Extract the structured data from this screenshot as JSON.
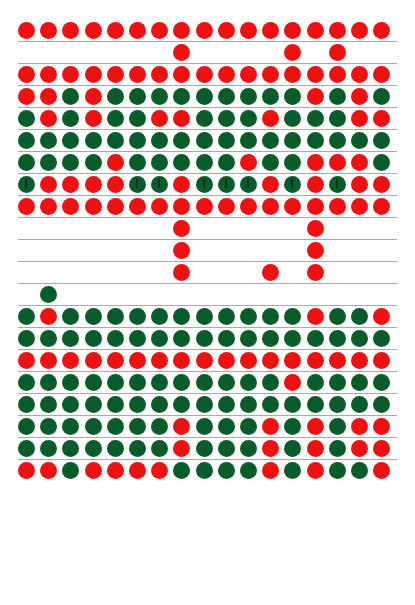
{
  "page": {
    "background_color": "#ffffff",
    "width": 415,
    "height": 605
  },
  "legend": {
    "red_color": "#ee1111",
    "green_color": "#0b5c2b",
    "rule_color": "#a9a9a9",
    "red_label": "red dot",
    "green_label": "green dot",
    "empty_label": "empty cell"
  },
  "grid": {
    "columns": 17,
    "column_start_x": 18,
    "column_pitch": 22.2,
    "dot_diameter": 17,
    "row_height": 22,
    "row_count": 24
  },
  "chart_data": {
    "type": "heatmap",
    "xlabel": "",
    "ylabel": "",
    "categories": [
      1,
      2,
      3,
      4,
      5,
      6,
      7,
      8,
      9,
      10,
      11,
      12,
      13,
      14,
      15,
      16,
      17
    ],
    "legend": {
      "R": "red",
      "G": "green",
      ".": "empty",
      "M": "green with mark"
    },
    "rows": [
      {
        "index": 1,
        "top": 20,
        "rule_below": true,
        "cells": [
          "R",
          "R",
          "R",
          "R",
          "R",
          "R",
          "R",
          "R",
          "R",
          "R",
          "R",
          "R",
          "R",
          "R",
          "R",
          "R",
          "R"
        ]
      },
      {
        "index": 2,
        "top": 42,
        "rule_below": true,
        "cells": [
          ".",
          ".",
          ".",
          ".",
          ".",
          ".",
          ".",
          "R",
          ".",
          ".",
          ".",
          ".",
          "R",
          ".",
          "R",
          ".",
          "."
        ]
      },
      {
        "index": 3,
        "top": 64,
        "rule_below": true,
        "cells": [
          "R",
          "R",
          "R",
          "R",
          "R",
          "R",
          "R",
          "R",
          "R",
          "R",
          "R",
          "R",
          "R",
          "R",
          "R",
          "R",
          "R"
        ]
      },
      {
        "index": 4,
        "top": 86,
        "rule_below": true,
        "cells": [
          "R",
          "R",
          "G",
          "R",
          "G",
          "G",
          "G",
          "G",
          "G",
          "G",
          "G",
          "G",
          "G",
          "R",
          "G",
          "R",
          "G"
        ]
      },
      {
        "index": 5,
        "top": 108,
        "rule_below": true,
        "cells": [
          "G",
          "R",
          "G",
          "R",
          "G",
          "G",
          "R",
          "R",
          "G",
          "G",
          "G",
          "R",
          "G",
          "G",
          "G",
          "R",
          "R"
        ]
      },
      {
        "index": 6,
        "top": 130,
        "rule_below": true,
        "cells": [
          "G",
          "G",
          "G",
          "G",
          "G",
          "G",
          "G",
          "G",
          "G",
          "G",
          "G",
          "G",
          "G",
          "G",
          "G",
          "G",
          "G"
        ]
      },
      {
        "index": 7,
        "top": 152,
        "rule_below": true,
        "cells": [
          "G",
          "G",
          "G",
          "G",
          "R",
          "G",
          "G",
          "G",
          "G",
          "G",
          "R",
          "G",
          "G",
          "R",
          "R",
          "R",
          "G"
        ]
      },
      {
        "index": 8,
        "top": 174,
        "rule_below": true,
        "cells": [
          "M",
          "R",
          "R",
          "R",
          "R",
          "M",
          "M",
          "R",
          "M",
          "M",
          "M",
          "R",
          "M",
          "R",
          "M",
          "R",
          "R"
        ]
      },
      {
        "index": 9,
        "top": 196,
        "rule_below": true,
        "cells": [
          "R",
          "R",
          "R",
          "R",
          "R",
          "R",
          "R",
          "R",
          "R",
          "R",
          "R",
          "R",
          "R",
          "R",
          "R",
          "R",
          "R"
        ]
      },
      {
        "index": 10,
        "top": 218,
        "rule_below": true,
        "cells": [
          ".",
          ".",
          ".",
          ".",
          ".",
          ".",
          ".",
          "R",
          ".",
          ".",
          ".",
          ".",
          ".",
          "R",
          ".",
          ".",
          "."
        ]
      },
      {
        "index": 11,
        "top": 240,
        "rule_below": true,
        "cells": [
          ".",
          ".",
          ".",
          ".",
          ".",
          ".",
          ".",
          "R",
          ".",
          ".",
          ".",
          ".",
          ".",
          "R",
          ".",
          ".",
          "."
        ]
      },
      {
        "index": 12,
        "top": 262,
        "rule_below": true,
        "cells": [
          ".",
          ".",
          ".",
          ".",
          ".",
          ".",
          ".",
          "R",
          ".",
          ".",
          ".",
          "R",
          ".",
          "R",
          ".",
          ".",
          "."
        ]
      },
      {
        "index": 13,
        "top": 284,
        "rule_below": true,
        "cells": [
          ".",
          "G",
          ".",
          ".",
          ".",
          ".",
          ".",
          ".",
          ".",
          ".",
          ".",
          ".",
          ".",
          ".",
          ".",
          ".",
          "."
        ]
      },
      {
        "index": 14,
        "top": 306,
        "rule_below": true,
        "cells": [
          "G",
          "R",
          "G",
          "G",
          "G",
          "G",
          "G",
          "G",
          "G",
          "G",
          "G",
          "G",
          "G",
          "R",
          "G",
          "G",
          "R"
        ]
      },
      {
        "index": 15,
        "top": 328,
        "rule_below": true,
        "cells": [
          "G",
          "G",
          "G",
          "G",
          "G",
          "G",
          "G",
          "G",
          "G",
          "G",
          "G",
          "G",
          "G",
          "G",
          "G",
          "G",
          "G"
        ]
      },
      {
        "index": 16,
        "top": 350,
        "rule_below": true,
        "cells": [
          "R",
          "R",
          "R",
          "R",
          "R",
          "R",
          "R",
          "R",
          "R",
          "R",
          "R",
          "R",
          "R",
          "R",
          "R",
          "R",
          "R"
        ]
      },
      {
        "index": 17,
        "top": 372,
        "rule_below": true,
        "cells": [
          "G",
          "G",
          "G",
          "G",
          "G",
          "G",
          "G",
          "G",
          "G",
          "G",
          "G",
          "G",
          "R",
          "G",
          "G",
          "G",
          "G"
        ]
      },
      {
        "index": 18,
        "top": 394,
        "rule_below": true,
        "cells": [
          "G",
          "G",
          "G",
          "G",
          "G",
          "G",
          "G",
          "G",
          "G",
          "G",
          "G",
          "G",
          "G",
          "G",
          "G",
          "G",
          "G"
        ]
      },
      {
        "index": 19,
        "top": 416,
        "rule_below": true,
        "cells": [
          "G",
          "G",
          "G",
          "G",
          "G",
          "G",
          "G",
          "R",
          "G",
          "G",
          "G",
          "R",
          "G",
          "R",
          "G",
          "R",
          "R"
        ]
      },
      {
        "index": 20,
        "top": 438,
        "rule_below": true,
        "cells": [
          "G",
          "G",
          "G",
          "G",
          "G",
          "G",
          "G",
          "R",
          "G",
          "G",
          "G",
          "R",
          "G",
          "R",
          "G",
          "R",
          "R"
        ]
      },
      {
        "index": 21,
        "top": 460,
        "rule_below": false,
        "cells": [
          "R",
          "R",
          "G",
          "R",
          "R",
          "R",
          "R",
          "G",
          "G",
          "G",
          "G",
          "R",
          "G",
          "R",
          "G",
          "G",
          "R"
        ]
      }
    ]
  }
}
